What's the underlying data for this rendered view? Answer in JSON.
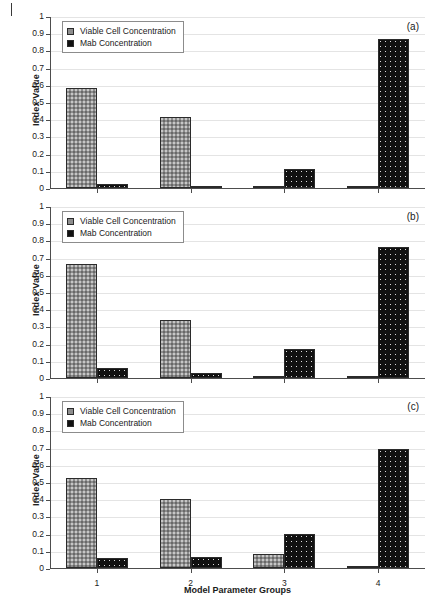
{
  "figure": {
    "page_mark": "page-edge-tick",
    "xlabel": "Model Parameter Groups",
    "ylabel": "Index Value"
  },
  "legend": {
    "series": [
      {
        "key": "vcc",
        "label": "Viable Cell Concentration",
        "color": "#8d8d8d",
        "pattern": "dotted-gray"
      },
      {
        "key": "mab",
        "label": "Mab Concentration",
        "color": "#111111",
        "pattern": "dotted-black"
      }
    ]
  },
  "axis": {
    "ytick_labels": [
      "1",
      "0.9",
      "0.8",
      "0.7",
      "0.6",
      "0.5",
      "0.4",
      "0.3",
      "0.2",
      "0.1",
      "0"
    ],
    "xtick_labels": [
      "1",
      "2",
      "3",
      "4"
    ],
    "ylim": [
      0,
      1
    ]
  },
  "panels": [
    {
      "tag": "(a)"
    },
    {
      "tag": "(b)"
    },
    {
      "tag": "(c)"
    }
  ],
  "chart_data": [
    {
      "type": "bar",
      "panel": "(a)",
      "title": "",
      "xlabel": "Model Parameter Groups",
      "ylabel": "Index Value",
      "categories": [
        "1",
        "2",
        "3",
        "4"
      ],
      "ylim": [
        0,
        1
      ],
      "grid": true,
      "legend_position": "top-left",
      "series": [
        {
          "name": "Viable Cell Concentration",
          "values": [
            0.58,
            0.41,
            0.008,
            0.012
          ]
        },
        {
          "name": "Mab Concentration",
          "values": [
            0.025,
            0.008,
            0.112,
            0.865
          ]
        }
      ]
    },
    {
      "type": "bar",
      "panel": "(b)",
      "title": "",
      "xlabel": "Model Parameter Groups",
      "ylabel": "Index Value",
      "categories": [
        "1",
        "2",
        "3",
        "4"
      ],
      "ylim": [
        0,
        1
      ],
      "grid": true,
      "legend_position": "top-left",
      "series": [
        {
          "name": "Viable Cell Concentration",
          "values": [
            0.662,
            0.338,
            0.006,
            0.006
          ]
        },
        {
          "name": "Mab Concentration",
          "values": [
            0.058,
            0.027,
            0.168,
            0.76
          ]
        }
      ]
    },
    {
      "type": "bar",
      "panel": "(c)",
      "title": "",
      "xlabel": "Model Parameter Groups",
      "ylabel": "Index Value",
      "categories": [
        "1",
        "2",
        "3",
        "4"
      ],
      "ylim": [
        0,
        1
      ],
      "grid": true,
      "legend_position": "top-left",
      "series": [
        {
          "name": "Viable Cell Concentration",
          "values": [
            0.522,
            0.402,
            0.082,
            0.008
          ]
        },
        {
          "name": "Mab Concentration",
          "values": [
            0.058,
            0.065,
            0.196,
            0.69
          ]
        }
      ]
    }
  ]
}
